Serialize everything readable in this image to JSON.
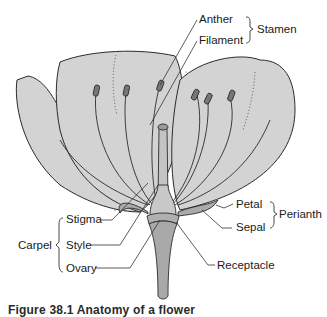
{
  "diagram": {
    "labels": {
      "anther": "Anther",
      "filament": "Filament",
      "stamen": "Stamen",
      "petal": "Petal",
      "sepal": "Sepal",
      "perianth": "Perianth",
      "stigma": "Stigma",
      "style": "Style",
      "ovary": "Ovary",
      "carpel": "Carpel",
      "receptacle": "Receptacle"
    },
    "groups": [
      {
        "name": "Stamen",
        "members": [
          "Anther",
          "Filament"
        ]
      },
      {
        "name": "Perianth",
        "members": [
          "Petal",
          "Sepal"
        ]
      },
      {
        "name": "Carpel",
        "members": [
          "Stigma",
          "Style",
          "Ovary"
        ]
      }
    ],
    "caption": "Figure 38.1  Anatomy of a flower",
    "colors": {
      "petal_fill": "#d3d3d3",
      "stem_fill": "#a9a9a9",
      "outline": "#2b2b2b"
    }
  }
}
